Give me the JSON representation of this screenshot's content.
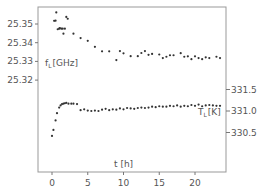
{
  "chart_data": {
    "type": "scatter",
    "title": "",
    "xlabel": "t [h]",
    "xlim": [
      -1.5,
      24.5
    ],
    "xticks": [
      0,
      5,
      10,
      15,
      20
    ],
    "xtick_labels": [
      "0",
      "5",
      "10",
      "15",
      "20"
    ],
    "y_left": {
      "label": "f_L [GHz]",
      "label_main": "f",
      "label_sub": "L",
      "label_unit": "[GHz]",
      "ticks": [
        25.35,
        25.34,
        25.33,
        25.32
      ],
      "tick_labels": [
        "25.35",
        "25.34",
        "25.33",
        "25.32"
      ]
    },
    "y_right": {
      "label": "T_L [K]",
      "label_main": "T",
      "label_sub": "L",
      "label_unit": "[K]",
      "ticks": [
        331.5,
        331.0,
        330.5
      ],
      "tick_labels": [
        "331.5",
        "331.0",
        "330.5"
      ]
    },
    "grid": false,
    "legend": null,
    "series": [
      {
        "name": "f_L",
        "axis": "left",
        "x": [
          0.3,
          0.5,
          0.6,
          0.8,
          1.0,
          1.1,
          1.3,
          1.5,
          1.6,
          1.8,
          2.0,
          2.2,
          3.0,
          4.0,
          5.0,
          6.0,
          7.0,
          8.0,
          9.0,
          9.5,
          10.0,
          11.0,
          12.0,
          12.5,
          13.0,
          13.5,
          14.0,
          15.0,
          15.5,
          16.0,
          16.5,
          17.0,
          18.0,
          18.5,
          19.0,
          19.5,
          20.0,
          20.5,
          21.0,
          21.5,
          22.0,
          23.0,
          23.5
        ],
        "y": [
          25.3517,
          25.3518,
          25.3562,
          25.3472,
          25.3475,
          25.3478,
          25.3475,
          25.3475,
          25.3448,
          25.3475,
          25.3538,
          25.3528,
          25.3448,
          25.3425,
          25.341,
          25.3378,
          25.3354,
          25.3354,
          25.3307,
          25.3355,
          25.3343,
          25.3328,
          25.3328,
          25.3345,
          25.3355,
          25.3335,
          25.334,
          25.3337,
          25.3318,
          25.3325,
          25.3333,
          25.3333,
          25.3344,
          25.3325,
          25.3327,
          25.3312,
          25.3327,
          25.3318,
          25.3312,
          25.3322,
          25.3318,
          25.3325,
          25.3318
        ]
      },
      {
        "name": "T_L",
        "axis": "right",
        "x": [
          0.0,
          0.2,
          0.5,
          0.7,
          1.0,
          1.2,
          1.4,
          1.6,
          1.8,
          2.0,
          2.3,
          2.7,
          3.0,
          3.5,
          4.0,
          4.5,
          5.0,
          5.5,
          6.0,
          6.5,
          7.0,
          7.5,
          8.0,
          8.5,
          9.0,
          9.5,
          10.0,
          10.5,
          11.0,
          11.5,
          12.0,
          12.5,
          13.0,
          13.5,
          14.0,
          14.5,
          15.0,
          15.5,
          16.0,
          16.5,
          17.0,
          17.5,
          18.0,
          18.5,
          19.0,
          19.5,
          20.0,
          20.5,
          21.0,
          21.5,
          22.0,
          22.5,
          23.0,
          23.5
        ],
        "y": [
          330.42,
          330.56,
          330.78,
          330.95,
          331.08,
          331.13,
          331.16,
          331.17,
          331.18,
          331.19,
          331.17,
          331.17,
          331.17,
          331.16,
          331.02,
          331.04,
          331.01,
          331.0,
          331.01,
          331.0,
          331.03,
          331.05,
          331.02,
          331.04,
          331.03,
          331.06,
          331.04,
          331.07,
          331.06,
          331.05,
          331.07,
          331.08,
          331.07,
          331.08,
          331.1,
          331.09,
          331.11,
          331.1,
          331.1,
          331.12,
          331.11,
          331.13,
          331.1,
          331.12,
          331.11,
          331.14,
          331.12,
          331.15,
          331.11,
          331.13,
          331.14,
          331.13,
          331.12,
          331.12
        ]
      }
    ]
  }
}
